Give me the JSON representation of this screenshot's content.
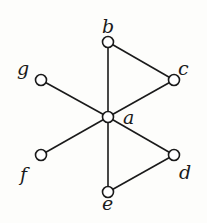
{
  "diagram": {
    "type": "graph",
    "nodes": [
      {
        "id": "a",
        "label": "a",
        "x": 108,
        "y": 117,
        "lx": 123,
        "ly": 124
      },
      {
        "id": "b",
        "label": "b",
        "x": 108,
        "y": 42,
        "lx": 102,
        "ly": 33
      },
      {
        "id": "c",
        "label": "c",
        "x": 174,
        "y": 80,
        "lx": 178,
        "ly": 75
      },
      {
        "id": "d",
        "label": "d",
        "x": 174,
        "y": 155,
        "lx": 179,
        "ly": 179
      },
      {
        "id": "e",
        "label": "e",
        "x": 108,
        "y": 192,
        "lx": 102,
        "ly": 210
      },
      {
        "id": "f",
        "label": "f",
        "x": 41,
        "y": 155,
        "lx": 20,
        "ly": 181
      },
      {
        "id": "g",
        "label": "g",
        "x": 41,
        "y": 80,
        "lx": 17,
        "ly": 75
      }
    ],
    "edges": [
      [
        "a",
        "b"
      ],
      [
        "a",
        "c"
      ],
      [
        "a",
        "d"
      ],
      [
        "a",
        "e"
      ],
      [
        "a",
        "f"
      ],
      [
        "a",
        "g"
      ],
      [
        "b",
        "c"
      ],
      [
        "d",
        "e"
      ]
    ]
  }
}
